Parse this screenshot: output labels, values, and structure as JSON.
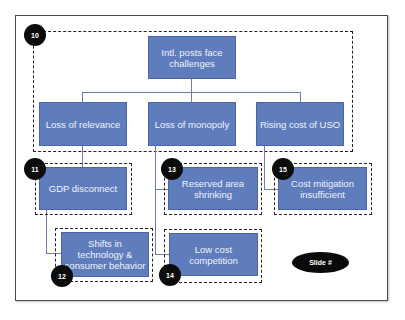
{
  "diagram": {
    "root": {
      "label": "Intl. posts face challenges",
      "badge": "10"
    },
    "level2": [
      {
        "label": "Loss of relevance"
      },
      {
        "label": "Loss of monopoly"
      },
      {
        "label": "Rising cost of USO"
      }
    ],
    "level3": [
      {
        "label": "GDP disconnect",
        "badge": "11",
        "parent": "Loss of relevance"
      },
      {
        "label": "Shifts in technology & consumer behavior",
        "badge": "12",
        "parent": "GDP disconnect"
      },
      {
        "label": "Reserved area shrinking",
        "badge": "13",
        "parent": "Loss of monopoly"
      },
      {
        "label": "Low cost competition",
        "badge": "14",
        "parent": "Loss of monopoly"
      },
      {
        "label": "Cost mitigation insufficient",
        "badge": "15",
        "parent": "Rising cost of USO"
      }
    ],
    "slide_label": "Slide #",
    "colors": {
      "box_fill": "#5f7dbc",
      "box_text": "#eef2fb",
      "badge": "#0c0c0c",
      "connector": "#6d7fa8"
    }
  }
}
